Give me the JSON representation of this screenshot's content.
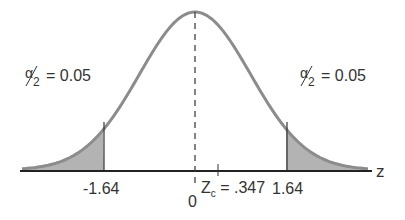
{
  "chart_data": {
    "type": "area",
    "title": "",
    "xlabel": "z",
    "ylabel": "",
    "mean": 0,
    "critical_values": [
      -1.64,
      1.64
    ],
    "test_statistic": {
      "label": "Z",
      "subscript": "c",
      "value": ".347"
    },
    "tail_areas": [
      {
        "side": "left",
        "label_num": "α",
        "label_den": "2",
        "value": "0.05"
      },
      {
        "side": "right",
        "label_num": "α",
        "label_den": "2",
        "value": "0.05"
      }
    ],
    "tick_labels": [
      "-1.64",
      "0",
      "1.64"
    ],
    "axis_label": "z",
    "shade_color": "#b3b3b3",
    "curve_color": "#8c8c8c"
  }
}
